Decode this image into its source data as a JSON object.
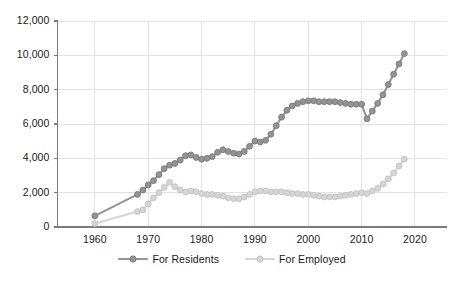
{
  "chart_data": {
    "type": "line",
    "title": "",
    "xlabel": "",
    "ylabel": "",
    "xlim": [
      1953,
      2026
    ],
    "ylim": [
      0,
      12000
    ],
    "grid": true,
    "legend_position": "bottom-center",
    "xticks": [
      1960,
      1970,
      1980,
      1990,
      2000,
      2010,
      2020
    ],
    "xtick_labels": [
      "1960",
      "1970",
      "1980",
      "1990",
      "2000",
      "2010",
      "2020"
    ],
    "yticks": [
      0,
      2000,
      4000,
      6000,
      8000,
      10000,
      12000
    ],
    "ytick_labels": [
      "0",
      "2,000",
      "4,000",
      "6,000",
      "8,000",
      "10,000",
      "12,000"
    ],
    "colors": {
      "for_residents": "#949494",
      "for_residents_stroke": "#7d7d7d",
      "for_employed": "#d6d6d6",
      "for_employed_stroke": "#c4c4c4",
      "axis": "#7a7a7a",
      "grid": "#e2e2e2",
      "text": "#1a1a1a"
    },
    "series": [
      {
        "name": "For Residents",
        "color": "#949494",
        "x": [
          1960,
          1968,
          1969,
          1970,
          1971,
          1972,
          1973,
          1974,
          1975,
          1976,
          1977,
          1978,
          1979,
          1980,
          1981,
          1982,
          1983,
          1984,
          1985,
          1986,
          1987,
          1988,
          1989,
          1990,
          1991,
          1992,
          1993,
          1994,
          1995,
          1996,
          1997,
          1998,
          1999,
          2000,
          2001,
          2002,
          2003,
          2004,
          2005,
          2006,
          2007,
          2008,
          2009,
          2010,
          2011,
          2012,
          2013,
          2014,
          2015,
          2016,
          2017,
          2018
        ],
        "values": [
          650,
          1900,
          2150,
          2450,
          2700,
          3050,
          3400,
          3600,
          3700,
          3900,
          4150,
          4200,
          4050,
          3950,
          4000,
          4100,
          4350,
          4500,
          4400,
          4300,
          4250,
          4400,
          4700,
          5000,
          4950,
          5050,
          5400,
          5900,
          6400,
          6800,
          7050,
          7200,
          7300,
          7350,
          7350,
          7300,
          7300,
          7300,
          7300,
          7250,
          7200,
          7150,
          7150,
          7150,
          6300,
          6750,
          7200,
          7700,
          8300,
          8900,
          9500,
          10100
        ]
      },
      {
        "name": "For Employed",
        "color": "#d6d6d6",
        "x": [
          1960,
          1968,
          1969,
          1970,
          1971,
          1972,
          1973,
          1974,
          1975,
          1976,
          1977,
          1978,
          1979,
          1980,
          1981,
          1982,
          1983,
          1984,
          1985,
          1986,
          1987,
          1988,
          1989,
          1990,
          1991,
          1992,
          1993,
          1994,
          1995,
          1996,
          1997,
          1998,
          1999,
          2000,
          2001,
          2002,
          2003,
          2004,
          2005,
          2006,
          2007,
          2008,
          2009,
          2010,
          2011,
          2012,
          2013,
          2014,
          2015,
          2016,
          2017,
          2018
        ],
        "values": [
          200,
          900,
          1000,
          1350,
          1700,
          2000,
          2300,
          2600,
          2350,
          2150,
          2050,
          2100,
          2050,
          1950,
          1900,
          1900,
          1850,
          1800,
          1700,
          1650,
          1650,
          1750,
          1900,
          2050,
          2100,
          2100,
          2050,
          2050,
          2050,
          2000,
          1950,
          1950,
          1900,
          1900,
          1850,
          1800,
          1750,
          1750,
          1750,
          1800,
          1850,
          1900,
          1950,
          2000,
          1950,
          2100,
          2250,
          2500,
          2800,
          3150,
          3550,
          3950
        ]
      }
    ]
  },
  "legend": {
    "items": [
      {
        "label": "For Residents"
      },
      {
        "label": "For Employed"
      }
    ]
  }
}
